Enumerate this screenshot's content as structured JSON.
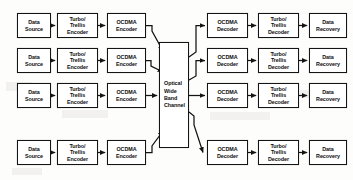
{
  "diagram": {
    "lane_count": 4,
    "stroke_color": "#141414",
    "box_fill": "#ffffff",
    "background": "#fdfdfc",
    "channel": {
      "label_lines": [
        "Optical",
        "Wide",
        "Band",
        "Channel"
      ],
      "x": 159,
      "y": 42,
      "width": 30,
      "height": 106
    },
    "columns": [
      {
        "key": "data_source",
        "label_lines": [
          "Data",
          "Source"
        ],
        "x": 17,
        "width": 34
      },
      {
        "key": "turbo_encoder",
        "label_lines": [
          "Turbo/",
          "Trellis",
          "Encoder"
        ],
        "x": 57,
        "width": 41
      },
      {
        "key": "ocdma_encoder",
        "label_lines": [
          "OCDMA",
          "Encoder"
        ],
        "x": 107,
        "width": 39
      },
      {
        "key": "ocdma_decoder",
        "label_lines": [
          "OCDMA",
          "Decoder"
        ],
        "x": 207,
        "width": 41
      },
      {
        "key": "turbo_decoder",
        "label_lines": [
          "Turbo/",
          "Trellis",
          "Decoder"
        ],
        "x": 258,
        "width": 41
      },
      {
        "key": "data_recovery",
        "label_lines": [
          "Data",
          "Recovery"
        ],
        "x": 309,
        "width": 38
      }
    ],
    "lanes": [
      {
        "index": 1,
        "y": 13,
        "height": 25
      },
      {
        "index": 2,
        "y": 48,
        "height": 25
      },
      {
        "index": 3,
        "y": 83,
        "height": 25
      },
      {
        "index": 4,
        "y": 140,
        "height": 25
      }
    ],
    "transmit_chain": [
      "Data Source",
      "Turbo/Trellis Encoder",
      "OCDMA Encoder"
    ],
    "receive_chain": [
      "OCDMA Decoder",
      "Turbo/Trellis Decoder",
      "Data Recovery"
    ],
    "flow_direction": "left-to-right"
  }
}
